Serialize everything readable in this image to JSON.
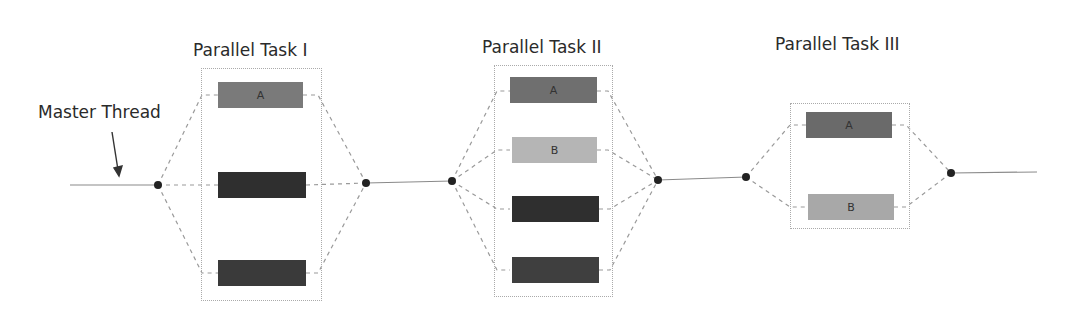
{
  "master_label": "Master Thread",
  "groups": [
    {
      "title": "Parallel Task I",
      "tasks": [
        {
          "label": "A",
          "shade": "#7a7a7a"
        },
        {
          "label": "",
          "shade": "#2f2f2f"
        },
        {
          "label": "",
          "shade": "#3a3a3a"
        }
      ]
    },
    {
      "title": "Parallel Task II",
      "tasks": [
        {
          "label": "A",
          "shade": "#6f6f6f"
        },
        {
          "label": "B",
          "shade": "#b5b5b5"
        },
        {
          "label": "",
          "shade": "#2f2f2f"
        },
        {
          "label": "",
          "shade": "#3f3f3f"
        }
      ]
    },
    {
      "title": "Parallel Task III",
      "tasks": [
        {
          "label": "A",
          "shade": "#6a6a6a"
        },
        {
          "label": "B",
          "shade": "#a8a8a8"
        }
      ]
    }
  ]
}
